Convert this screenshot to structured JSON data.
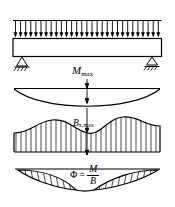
{
  "figure": {
    "type": "structural-engineering-beam-diagram",
    "background_color": "#ffffff",
    "line_color": "#000000",
    "width": 175,
    "height": 207,
    "panels": [
      {
        "name": "loaded-beam",
        "description": "Simply supported beam under uniformly distributed load",
        "label": ""
      },
      {
        "name": "bending-moment-diagram",
        "description": "Parabolic bending moment diagram",
        "label": "M_max"
      },
      {
        "name": "rigidity-diagram",
        "description": "Hatched diagram of section rigidity B",
        "label": "B_x.max"
      },
      {
        "name": "curvature-diagram",
        "description": "Curvature diagram with two hatched lens regions",
        "label": "Phi = M / B"
      }
    ]
  },
  "labels": {
    "m_max": {
      "variable": "M",
      "subscript": "max"
    },
    "b_max": {
      "variable": "B",
      "subscript": "x.max"
    },
    "phi_formula": {
      "symbol": "Φ",
      "equals": "=",
      "numerator": "M",
      "denominator": "B"
    }
  },
  "load": {
    "arrow_count": 29,
    "direction": "down",
    "label": ""
  },
  "supports": {
    "left": "pin-support-hatched",
    "right": "roller-support-hatched"
  },
  "colors": {
    "ink": "#000000",
    "paper": "#ffffff"
  }
}
